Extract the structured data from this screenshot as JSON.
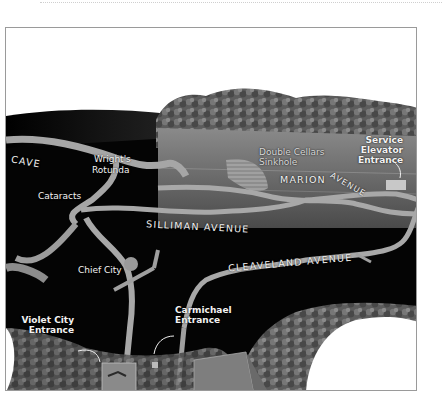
{
  "map": {
    "type": "illustrated cave cross-section",
    "colors": {
      "background_cave": "#050505",
      "passage": "#a8a8a8",
      "surface_ground": "#6e6e6e",
      "forest": "#5a5a5a",
      "sky": "#ffffff",
      "label": "#f2f2f2",
      "frame_border": "#9a9a9a"
    },
    "labels": {
      "cave": "CAVE",
      "wrights_rotunda": "Wright's\nRotunda",
      "wrights_rotunda_line1": "Wright's",
      "wrights_rotunda_line2": "Rotunda",
      "cataracts": "Cataracts",
      "double_cellars_line1": "Double Cellars",
      "double_cellars_line2": "Sinkhole",
      "marion": "MARION",
      "avenue_marion": "AVENUE",
      "service_line1": "Service",
      "service_line2": "Elevator",
      "service_line3": "Entrance",
      "silliman_avenue": "SILLIMAN AVENUE",
      "cleaveland_avenue": "CLEAVELAND AVENUE",
      "chief_city": "Chief City",
      "violet_city_line1": "Violet City",
      "violet_city_line2": "Entrance",
      "carmichael_line1": "Carmichael",
      "carmichael_line2": "Entrance"
    }
  }
}
